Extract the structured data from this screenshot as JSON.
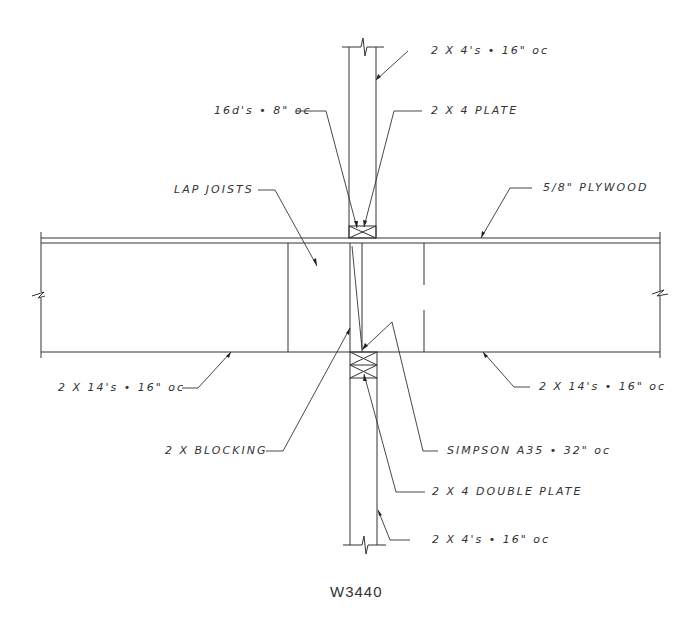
{
  "drawing": {
    "title": "W3440",
    "type": "wall-floor framing section detail",
    "callouts": {
      "top_studs": "2 X 4's • 16\" oc",
      "nails": "16d's • 8\" oc",
      "top_plate": "2 X 4 PLATE",
      "lap_joists": "LAP JOISTS",
      "plywood": "5/8\" PLYWOOD",
      "left_joists": "2 X 14's • 16\" oc",
      "right_joists": "2 X 14's • 16\" oc",
      "blocking": "2 X BLOCKING",
      "simpson": "SIMPSON A35 • 32\" oc",
      "double_plate": "2 X 4 DOUBLE PLATE",
      "bottom_studs": "2 X 4's • 16\" oc"
    },
    "colors": {
      "background": "#ffffff",
      "linework": "#333333",
      "text": "#333333"
    }
  }
}
